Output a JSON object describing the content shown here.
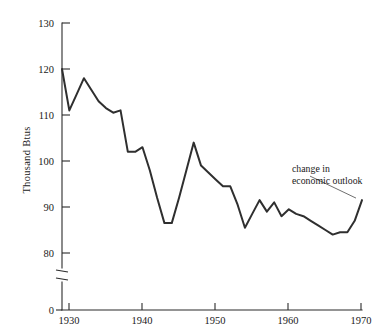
{
  "chart_data": {
    "type": "line",
    "title": "",
    "subtitle": "",
    "xlabel": "",
    "ylabel": "Thousand  Btus",
    "xlim": [
      1929,
      1970
    ],
    "ylim": [
      80,
      130
    ],
    "yaxis_has_break": true,
    "yaxis_break_between": [
      0,
      80
    ],
    "grid": false,
    "legend": "none",
    "xticks": [
      1930,
      1940,
      1950,
      1960,
      1970
    ],
    "xtick_labels": [
      "1930",
      "1940",
      "1950",
      "1960",
      "1970"
    ],
    "yticks": [
      0,
      80,
      90,
      100,
      110,
      120,
      130
    ],
    "ytick_labels": [
      "0",
      "80",
      "90",
      "100",
      "110",
      "120",
      "130"
    ],
    "series": [
      {
        "name": "Thousand Btus per unit",
        "x": [
          1929,
          1930,
          1931,
          1932,
          1933,
          1934,
          1935,
          1936,
          1937,
          1938,
          1939,
          1940,
          1941,
          1942,
          1943,
          1944,
          1945,
          1946,
          1947,
          1948,
          1949,
          1950,
          1951,
          1952,
          1953,
          1954,
          1955,
          1956,
          1957,
          1958,
          1959,
          1960,
          1961,
          1962,
          1963,
          1964,
          1965,
          1966,
          1967,
          1968,
          1969,
          1970
        ],
        "values": [
          120.0,
          111.0,
          114.5,
          118.0,
          115.5,
          113.0,
          111.5,
          110.5,
          111.0,
          102.0,
          102.0,
          103.0,
          98.0,
          92.0,
          86.5,
          86.5,
          92.0,
          98.0,
          104.0,
          99.0,
          97.5,
          96.0,
          94.5,
          94.5,
          90.5,
          85.5,
          88.5,
          91.5,
          89.0,
          91.0,
          88.0,
          89.5,
          88.5,
          88.0,
          87.0,
          86.0,
          85.0,
          84.0,
          84.5,
          84.5,
          87.0,
          91.5
        ]
      }
    ],
    "annotations": [
      {
        "name": "change-in-economic-outlook",
        "lines": [
          "change in",
          "economic outlook"
        ],
        "text": "change in economic outlook",
        "points_to_year": 1970,
        "points_to_value": 91.5
      }
    ],
    "colors": {
      "line": "#2f2f2f",
      "axis": "#2b2b2b",
      "text": "#1a1a1a",
      "background": "#ffffff",
      "leader": "#4a4a4a"
    }
  }
}
